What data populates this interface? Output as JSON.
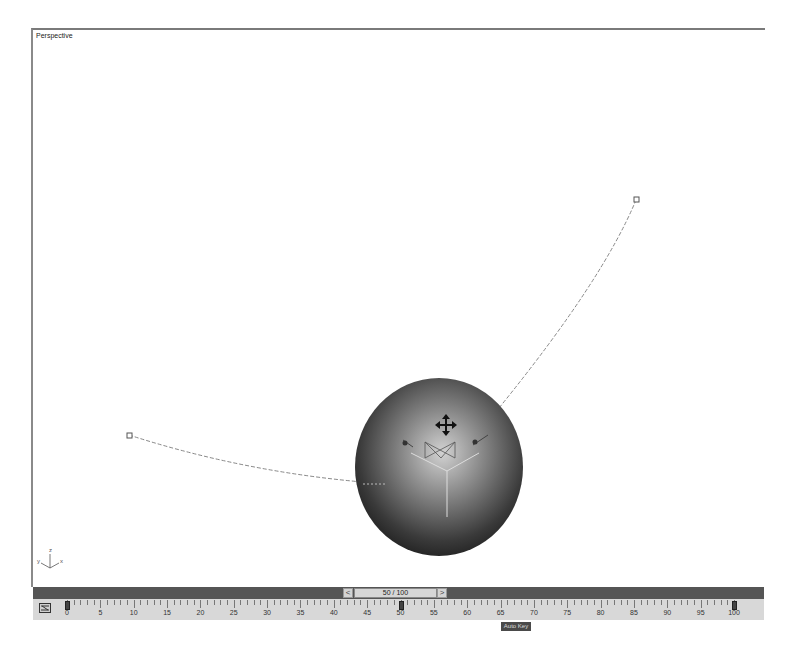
{
  "viewport": {
    "label": "Perspective",
    "axis_labels": {
      "x": "x",
      "y": "y",
      "z": "z"
    }
  },
  "scene": {
    "object": "sphere",
    "gizmo": "move-transform-gizmo",
    "path_start_point": "keyframe-start",
    "path_end_point": "keyframe-end"
  },
  "timeslider": {
    "prev_label": "<",
    "position_label": "50 / 100",
    "next_label": ">",
    "current_frame": 50,
    "total_frames": 100
  },
  "trackbar": {
    "icon": "mini-curve-editor-icon",
    "tick_labels": [
      "0",
      "5",
      "10",
      "15",
      "20",
      "25",
      "30",
      "35",
      "40",
      "45",
      "50",
      "55",
      "60",
      "65",
      "70",
      "75",
      "80",
      "85",
      "90",
      "95",
      "100"
    ],
    "keys": [
      0,
      50,
      100
    ]
  },
  "tooltip": {
    "text": "Auto Key"
  },
  "colors": {
    "timeslider_bg": "#555555",
    "trackbar_bg": "#d8d8d8",
    "sphere_dark": "#2a2a2a",
    "sphere_light": "#d0d0d0"
  }
}
